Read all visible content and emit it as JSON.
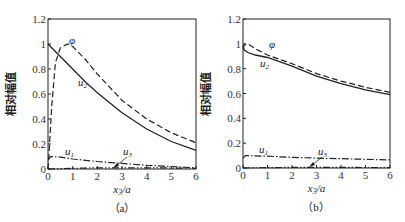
{
  "chart_data": [
    {
      "type": "line",
      "panel_label": "（a）",
      "xlabel": "x3/a",
      "ylabel": "相对幅值",
      "xlim": [
        0,
        6
      ],
      "ylim": [
        0,
        1.2
      ],
      "xticks": [
        "0",
        "1",
        "2",
        "3",
        "4",
        "5",
        "6"
      ],
      "yticks": [
        "0",
        "0.2",
        "0.4",
        "0.6",
        "0.8",
        "1",
        "1.2"
      ],
      "grid": false,
      "series": [
        {
          "name": "φ",
          "style": "dashed",
          "x": [
            0,
            0.05,
            0.15,
            0.3,
            0.5,
            0.8,
            1.0,
            1.5,
            2,
            3,
            4,
            5,
            6
          ],
          "y": [
            0,
            0.15,
            0.5,
            0.85,
            0.97,
            1.0,
            0.98,
            0.88,
            0.76,
            0.55,
            0.4,
            0.29,
            0.21
          ]
        },
        {
          "name": "u2",
          "style": "solid",
          "x": [
            0,
            0.5,
            1,
            1.5,
            2,
            3,
            4,
            5,
            6
          ],
          "y": [
            1.0,
            0.9,
            0.8,
            0.7,
            0.61,
            0.45,
            0.32,
            0.22,
            0.15
          ]
        },
        {
          "name": "u1",
          "style": "dash-dot",
          "x": [
            0,
            0.1,
            0.5,
            1,
            2,
            3,
            4,
            5,
            6
          ],
          "y": [
            0.07,
            0.1,
            0.095,
            0.08,
            0.06,
            0.045,
            0.03,
            0.02,
            0.01
          ]
        },
        {
          "name": "u3",
          "style": "dash-dot-dot",
          "x": [
            0,
            1,
            2,
            3,
            4,
            5,
            6
          ],
          "y": [
            0.0,
            0.005,
            0.01,
            0.01,
            0.01,
            0.008,
            0.006
          ]
        }
      ]
    },
    {
      "type": "line",
      "panel_label": "（b）",
      "xlabel": "x3/a",
      "ylabel": "相对幅值",
      "xlim": [
        0,
        6
      ],
      "ylim": [
        0,
        1.2
      ],
      "xticks": [
        "0",
        "1",
        "2",
        "3",
        "4",
        "5",
        "6"
      ],
      "yticks": [
        "0",
        "0.2",
        "0.4",
        "0.6",
        "0.8",
        "1",
        "1.2"
      ],
      "grid": false,
      "series": [
        {
          "name": "φ",
          "style": "dashed",
          "x": [
            0,
            0.05,
            0.2,
            0.5,
            1,
            2,
            3,
            4,
            5,
            6
          ],
          "y": [
            0.96,
            0.99,
            1.0,
            0.96,
            0.91,
            0.84,
            0.76,
            0.7,
            0.65,
            0.61
          ]
        },
        {
          "name": "u2",
          "style": "solid",
          "x": [
            0,
            0.05,
            0.2,
            0.5,
            1,
            2,
            3,
            4,
            5,
            6
          ],
          "y": [
            0.99,
            0.95,
            0.93,
            0.91,
            0.89,
            0.82,
            0.74,
            0.68,
            0.63,
            0.59
          ]
        },
        {
          "name": "u1",
          "style": "dash-dot",
          "x": [
            0,
            0.1,
            1,
            2,
            3,
            4,
            5,
            6
          ],
          "y": [
            0.08,
            0.1,
            0.095,
            0.085,
            0.08,
            0.075,
            0.07,
            0.065
          ]
        },
        {
          "name": "u3",
          "style": "dash-dot-dot",
          "x": [
            0,
            1,
            2,
            3,
            4,
            5,
            6
          ],
          "y": [
            0.0,
            0.003,
            0.005,
            0.005,
            0.005,
            0.004,
            0.003
          ]
        }
      ]
    }
  ],
  "annotations": {
    "a": {
      "phi": "φ",
      "u2": "u2",
      "u1": "u1",
      "u3": "u3"
    },
    "b": {
      "phi": "φ",
      "u2": "u2",
      "u1": "u1",
      "u3": "u3"
    }
  }
}
